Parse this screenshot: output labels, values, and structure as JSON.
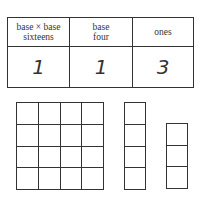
{
  "place_value_table": {
    "columns": [
      {
        "header_line1": "base × base",
        "header_line2": "sixteens",
        "value": "1"
      },
      {
        "header_line1": "base",
        "header_line2": "four",
        "value": "1"
      },
      {
        "header_line1": "ones",
        "header_line2": "",
        "value": "3"
      }
    ]
  },
  "blocks": [
    {
      "name": "flat-4x4",
      "rows": 4,
      "cols": 4
    },
    {
      "name": "long-4x1",
      "rows": 4,
      "cols": 1
    },
    {
      "name": "ones-3x1",
      "rows": 3,
      "cols": 1
    }
  ]
}
